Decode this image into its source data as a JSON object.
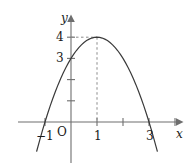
{
  "chart_data": {
    "type": "line",
    "title": "",
    "subtitle": "",
    "xlabel": "x",
    "ylabel": "y",
    "xlim": [
      -1.9,
      4.2
    ],
    "ylim": [
      -2.0,
      5.2
    ],
    "grid": false,
    "legend": null,
    "function": "y = -(x - 1)^2 + 4",
    "x_ticks": [
      {
        "value": -1,
        "label": "−1"
      },
      {
        "value": 1,
        "label": "1"
      },
      {
        "value": 2,
        "label": ""
      },
      {
        "value": 3,
        "label": "3"
      },
      {
        "value": 4,
        "label": ""
      }
    ],
    "y_ticks": [
      {
        "value": 1,
        "label": ""
      },
      {
        "value": 2,
        "label": ""
      },
      {
        "value": 3,
        "label": "3"
      },
      {
        "value": 4,
        "label": "4"
      }
    ],
    "origin_label": "O",
    "annotations": [
      {
        "name": "vertex",
        "x": 1,
        "y": 4,
        "style": "dashed-guides"
      },
      {
        "name": "y-intercept",
        "x": 0,
        "y": 3
      },
      {
        "name": "root-left",
        "x": -1,
        "y": 0
      },
      {
        "name": "root-right",
        "x": 3,
        "y": 0
      }
    ],
    "series": [
      {
        "name": "parabola",
        "color": "#3a3a3a",
        "x": [
          -1.32,
          -1.2,
          -1.1,
          -1.0,
          -0.9,
          -0.8,
          -0.7,
          -0.6,
          -0.5,
          -0.4,
          -0.3,
          -0.2,
          -0.1,
          0.0,
          0.1,
          0.2,
          0.3,
          0.4,
          0.5,
          0.6,
          0.7,
          0.8,
          0.9,
          1.0,
          1.1,
          1.2,
          1.3,
          1.4,
          1.5,
          1.6,
          1.7,
          1.8,
          1.9,
          2.0,
          2.1,
          2.2,
          2.3,
          2.4,
          2.5,
          2.6,
          2.7,
          2.8,
          2.9,
          3.0,
          3.1,
          3.2,
          3.3,
          3.32
        ],
        "y": [
          -1.38,
          -0.84,
          -0.41,
          0.0,
          0.39,
          0.76,
          1.11,
          1.44,
          1.75,
          2.04,
          2.31,
          2.56,
          2.79,
          3.0,
          3.19,
          3.36,
          3.51,
          3.64,
          3.75,
          3.84,
          3.91,
          3.96,
          3.99,
          4.0,
          3.99,
          3.96,
          3.91,
          3.84,
          3.75,
          3.64,
          3.51,
          3.36,
          3.19,
          3.0,
          2.79,
          2.56,
          2.31,
          2.04,
          1.75,
          1.44,
          1.11,
          0.76,
          0.39,
          0.0,
          -0.41,
          -0.84,
          -1.29,
          -1.38
        ]
      }
    ]
  },
  "axes": {
    "x_axis_name": "x",
    "y_axis_name": "y",
    "origin": "O"
  },
  "colors": {
    "curve": "#3a3a3a",
    "axis": "#6e6e6e",
    "guide": "#8a8a8a",
    "text": "#1a1a1a",
    "background": "#ffffff"
  }
}
